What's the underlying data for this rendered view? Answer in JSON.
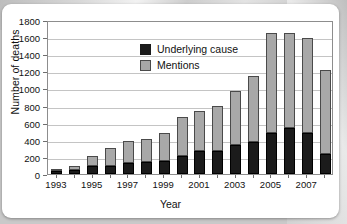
{
  "chart_data": {
    "type": "bar",
    "stacked": true,
    "title": "",
    "xlabel": "Year",
    "ylabel": "Number of deaths",
    "ylim": [
      0,
      1800
    ],
    "ytick_step": 200,
    "yticks": [
      0,
      200,
      400,
      600,
      800,
      1000,
      1200,
      1400,
      1600,
      1800
    ],
    "grid": true,
    "legend_position": "upper-left-inside",
    "categories": [
      1993,
      1994,
      1995,
      1996,
      1997,
      1998,
      1999,
      2000,
      2001,
      2002,
      2003,
      2004,
      2005,
      2006,
      2007,
      2008
    ],
    "xtick_labels": [
      "1993",
      "1995",
      "1997",
      "1999",
      "2001",
      "2003",
      "2005",
      "2007"
    ],
    "series": [
      {
        "name": "Underlying cause",
        "color": "#1b1b1b",
        "values": [
          30,
          45,
          95,
          95,
          125,
          135,
          150,
          210,
          270,
          270,
          340,
          375,
          485,
          535,
          480,
          235
        ]
      },
      {
        "name": "Mentions",
        "color": "#a8a8a8",
        "values": [
          20,
          45,
          115,
          210,
          265,
          280,
          330,
          460,
          465,
          525,
          625,
          765,
          1160,
          1115,
          1115,
          985
        ]
      }
    ],
    "totals": [
      50,
      90,
      210,
      305,
      390,
      415,
      480,
      670,
      735,
      795,
      965,
      1140,
      1645,
      1650,
      1595,
      1220
    ]
  },
  "legend": {
    "items": [
      {
        "label": "Underlying cause",
        "swatch": "underlying"
      },
      {
        "label": "Mentions",
        "swatch": "mentions"
      }
    ]
  },
  "colors": {
    "underlying": "#1b1b1b",
    "mentions": "#a8a8a8",
    "gridline": "#c4c4c4",
    "frame": "#8d8d8d",
    "card": "#ffffff",
    "backdrop": "#c9c9c9"
  }
}
